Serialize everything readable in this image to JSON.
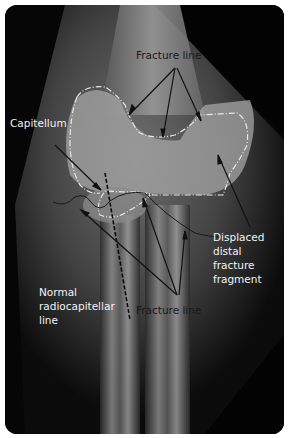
{
  "figure": {
    "labels": {
      "fracture_line_top": "Fracture line",
      "capitellum": "Capitellum",
      "displaced_fragment": "Displaced\ndistal\nfracture\nfragment",
      "radiocapitellar": "Normal\nradiocapitellar\nline",
      "fracture_line_bottom": "Fracture line"
    },
    "colors": {
      "border": "#ffffff",
      "background": "#050505",
      "annotation_dark": "#111111",
      "annotation_light": "#f2f2f2",
      "outline_dashed": "#e8e8e8"
    }
  }
}
